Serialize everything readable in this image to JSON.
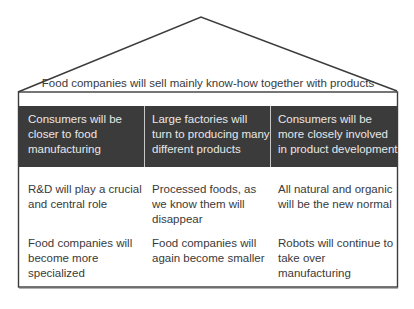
{
  "diagram": {
    "type": "house",
    "roof": {
      "label": "Food companies will sell mainly know-how together with products"
    },
    "header_row": [
      {
        "text": "Consumers will be closer to food manufacturing"
      },
      {
        "text": "Large factories will turn to producing many different products"
      },
      {
        "text": "Consumers will be more closely involved in product development"
      }
    ],
    "rows": [
      [
        {
          "text": "R&D will play a crucial and central role"
        },
        {
          "text": "Processed foods, as we know them will disappear"
        },
        {
          "text": "All natural and organic will be the new normal"
        }
      ],
      [
        {
          "text": "Food companies will become more specialized"
        },
        {
          "text": "Food companies will again become smaller"
        },
        {
          "text": "Robots will continue to take over manufacturing"
        }
      ]
    ],
    "colors": {
      "outline": "#3c3c3c",
      "header_band": "#3b3b3b",
      "header_text": "#e8e8e8",
      "body_text": "#3a3a3a",
      "background": "#ffffff"
    }
  }
}
